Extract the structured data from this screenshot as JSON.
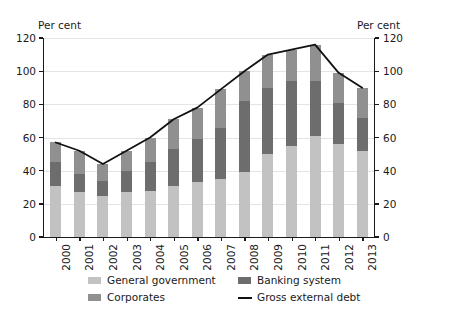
{
  "axes": {
    "unit_left": "Per cent",
    "unit_right": "Per cent",
    "yticks": [
      0,
      20,
      40,
      60,
      80,
      100,
      120
    ]
  },
  "legend": {
    "items": [
      {
        "label": "General government",
        "color": "#c2c2c2",
        "marker": "swatch"
      },
      {
        "label": "Banking system",
        "color": "#6d6d6d",
        "marker": "swatch"
      },
      {
        "label": "Corporates",
        "color": "#909090",
        "marker": "swatch"
      },
      {
        "label": "Gross external debt",
        "color": "#111111",
        "marker": "line"
      }
    ]
  },
  "chart_data": {
    "type": "bar",
    "title": "",
    "subtitle": "",
    "xlabel": "",
    "ylabel": "Per cent",
    "ylim": [
      0,
      120
    ],
    "yticks": [
      0,
      20,
      40,
      60,
      80,
      100,
      120
    ],
    "grid": true,
    "legend_position": "bottom",
    "stacked": true,
    "categories": [
      "2000",
      "2001",
      "2002",
      "2003",
      "2004",
      "2005",
      "2006",
      "2007",
      "2008",
      "2009",
      "2010",
      "2011",
      "2012",
      "2013"
    ],
    "series": [
      {
        "name": "General government",
        "type": "bar",
        "color": "#c2c2c2",
        "values": [
          31,
          27,
          25,
          27,
          28,
          31,
          33,
          35,
          39,
          50,
          55,
          61,
          56,
          52
        ]
      },
      {
        "name": "Banking system",
        "type": "bar",
        "color": "#6d6d6d",
        "values": [
          14,
          11,
          9,
          13,
          17,
          22,
          26,
          31,
          43,
          40,
          39,
          33,
          25,
          20
        ]
      },
      {
        "name": "Corporates",
        "type": "bar",
        "color": "#909090",
        "values": [
          12,
          14,
          10,
          12,
          15,
          18,
          19,
          23,
          18,
          20,
          19,
          22,
          18,
          18
        ]
      },
      {
        "name": "Gross external debt",
        "type": "line",
        "color": "#111111",
        "values": [
          57,
          52,
          44,
          52,
          60,
          71,
          78,
          89,
          100,
          110,
          113,
          116,
          99,
          90
        ]
      }
    ]
  }
}
